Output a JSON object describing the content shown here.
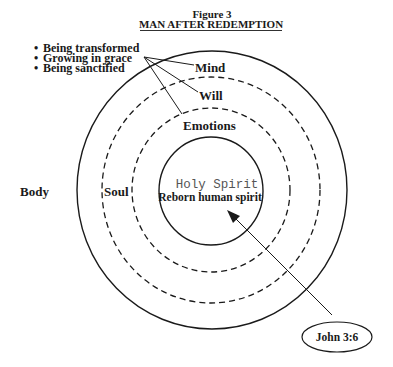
{
  "figure": {
    "number": "Figure 3",
    "title": "MAN AFTER REDEMPTION"
  },
  "bullets": [
    "Being transformed",
    "Growing in grace",
    "Being sanctified"
  ],
  "bullet_glyph": "•",
  "soul_parts": {
    "mind": "Mind",
    "will": "Will",
    "emotions": "Emotions"
  },
  "layers": {
    "body": "Body",
    "soul": "Soul",
    "spirit_top": "Holy Spirit",
    "spirit_bottom": "Reborn human spirit"
  },
  "reference": {
    "label": "John 3:6"
  },
  "colors": {
    "ink": "#1a1a1a",
    "mono_text": "#555555",
    "background": "#ffffff"
  }
}
